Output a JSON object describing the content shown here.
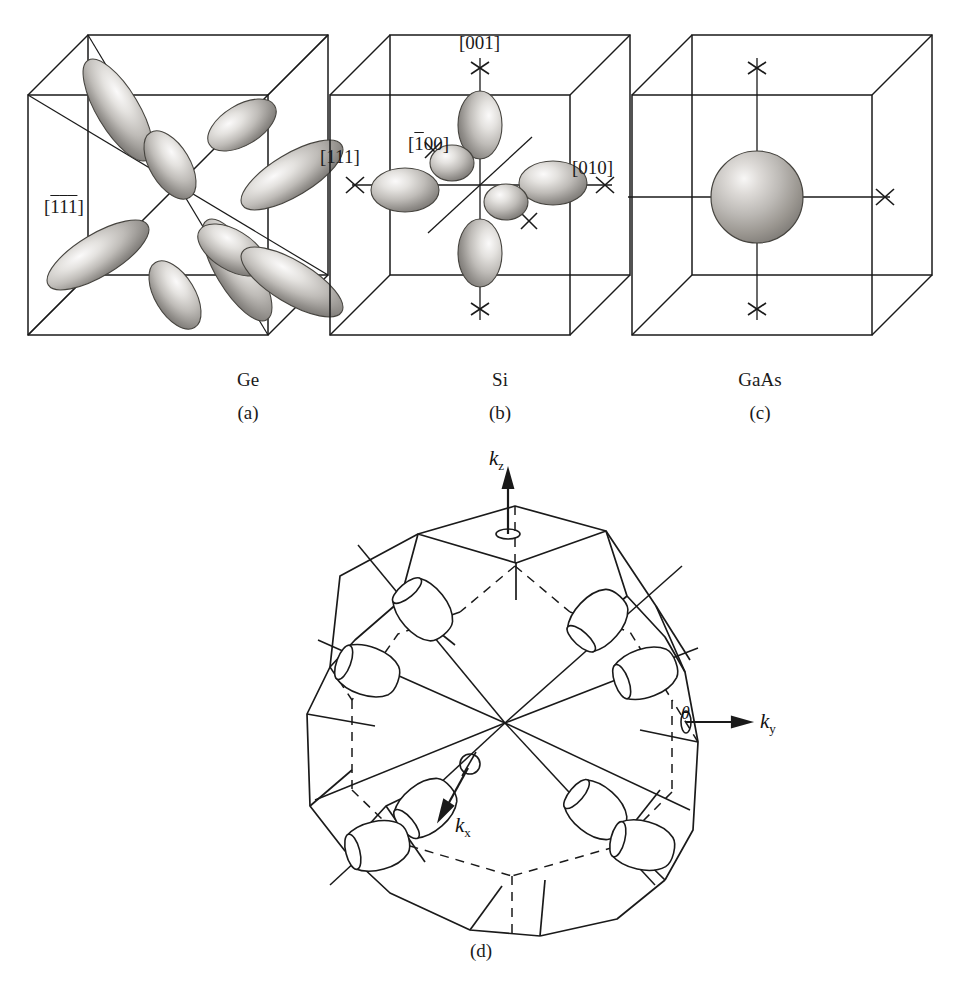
{
  "figure": {
    "background": "#ffffff",
    "ink": "#1a1a1a"
  },
  "panels": [
    {
      "key": "a",
      "material": "Ge",
      "sublabel": "(a)",
      "valley_type": "ellipsoid",
      "valley_count": 8,
      "description": "Eight half-prolate-ellipsoid valleys along the <111> cube diagonals",
      "direction_labels": [
        {
          "name": "direction-label-1bar1bar1bar",
          "bar": [
            true,
            true,
            true
          ],
          "digits": [
            "1",
            "1",
            "1"
          ],
          "text": "[111]"
        }
      ]
    },
    {
      "key": "b",
      "material": "Si",
      "sublabel": "(b)",
      "valley_type": "ellipsoid",
      "valley_count": 6,
      "description": "Six prolate ellipsoid valleys along the <100> cube axes",
      "direction_labels": [
        {
          "name": "direction-label-111",
          "bar": [
            false,
            false,
            false
          ],
          "digits": [
            "1",
            "1",
            "1"
          ],
          "text": "[111]"
        },
        {
          "name": "direction-label-001",
          "bar": [
            false,
            false,
            false
          ],
          "digits": [
            "0",
            "0",
            "1"
          ],
          "text": "[001]"
        },
        {
          "name": "direction-label-1bar00",
          "bar": [
            true,
            false,
            false
          ],
          "digits": [
            "1",
            "0",
            "0"
          ],
          "text": "[100]"
        },
        {
          "name": "direction-label-010",
          "bar": [
            false,
            false,
            false
          ],
          "digits": [
            "0",
            "1",
            "0"
          ],
          "text": "[010]"
        }
      ]
    },
    {
      "key": "c",
      "material": "GaAs",
      "sublabel": "(c)",
      "valley_type": "sphere",
      "valley_count": 1,
      "description": "Single spherical valley at the zone centre",
      "direction_labels": []
    }
  ],
  "brillouin": {
    "sublabel": "(d)",
    "shape": "truncated-octahedron",
    "description": "First Brillouin zone of the fcc lattice with eight <111> valley ellipsoids at the L points",
    "valley_count": 8,
    "axes": [
      {
        "name": "axis-kz",
        "symbol": "k",
        "subscript": "z"
      },
      {
        "name": "axis-ky",
        "symbol": "k",
        "subscript": "y"
      },
      {
        "name": "axis-kx",
        "symbol": "k",
        "subscript": "x"
      }
    ],
    "angles": [
      {
        "name": "angle-theta",
        "symbol": "θ"
      },
      {
        "name": "angle-phi",
        "symbol": "ϕ"
      }
    ]
  },
  "colors": {
    "line": "#1a1a1a",
    "ellipsoid_light": "#f2f0ee",
    "ellipsoid_mid": "#b9b6b3",
    "ellipsoid_dark": "#76736f",
    "ellipsoid_edge": "#4a4845"
  }
}
